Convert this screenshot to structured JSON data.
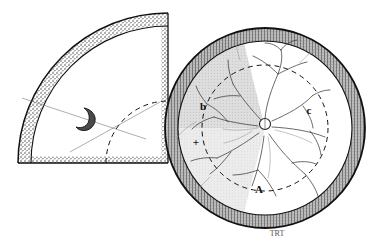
{
  "figure": {
    "medium": "pen-and-ink line drawing",
    "background_color": "#ffffff",
    "ink_color": "#111111",
    "shaded_sector_color": "#d9d9d9",
    "rim_texture": "stippled-ciliated-band",
    "signature": "TRT"
  },
  "left_panel": {
    "name": "magnified-quadrant-wedge",
    "shape": "quarter-sector",
    "apex": {
      "x": 168,
      "y": 163
    },
    "outer_radius": 150,
    "start_angle_deg": 180,
    "end_angle_deg": 270,
    "rim_band_thickness": 12,
    "inner_dashed_arc_radius": 62,
    "marker": {
      "name": "crescent-marker",
      "label": "",
      "x": 88,
      "y": 118,
      "shape": "crescent"
    },
    "leader_lines": [
      {
        "name": "leader-line-upper",
        "x1": 22,
        "y1": 98,
        "x2": 146,
        "y2": 139
      },
      {
        "name": "leader-line-lower",
        "x1": 70,
        "y1": 152,
        "x2": 160,
        "y2": 102
      }
    ]
  },
  "right_panel": {
    "name": "full-circular-fundus-view",
    "shape": "circle",
    "center": {
      "x": 265,
      "y": 128
    },
    "outer_radius": 100,
    "rim_band_thickness": 13,
    "dashed_circle_radius": 63,
    "shaded_sector": {
      "name": "highlighted-quadrant",
      "start_angle_deg": 178,
      "end_angle_deg": 256,
      "color": "#d9d9d9"
    },
    "optic_disc": {
      "name": "optic-disc",
      "x": 265,
      "y": 124,
      "radius": 5.5
    },
    "labels": [
      {
        "name": "label-b",
        "text": "b",
        "x": 203,
        "y": 110
      },
      {
        "name": "label-plus",
        "text": "+",
        "x": 196,
        "y": 146
      },
      {
        "name": "label-c",
        "text": "c",
        "x": 309,
        "y": 114
      },
      {
        "name": "label-a",
        "text": "A",
        "x": 259,
        "y": 192
      }
    ]
  },
  "annotations": {
    "signature_label": "TRT",
    "signature_x": 277,
    "signature_y": 235
  }
}
